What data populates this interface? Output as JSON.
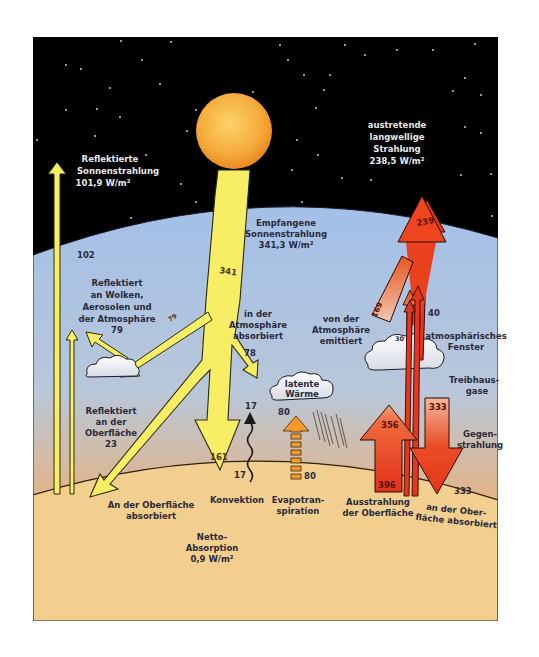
{
  "space": {
    "reflected_solar": {
      "title_line1": "Reflektierte",
      "title_line2": "Sonnenstrahlung",
      "value": "101,9 W/m²"
    },
    "outgoing_longwave": {
      "line1": "austretende",
      "line2": "langwellige",
      "line3": "Strahlung",
      "value": "238,5 W/m²"
    }
  },
  "atmosphere": {
    "incoming_solar": {
      "line1": "Empfangene",
      "line2": "Sonnenstrahlung",
      "value": "341,3 W/m²"
    },
    "reflected_clouds": {
      "line1": "Reflektiert",
      "line2": "an Wolken,",
      "line3": "Aerosolen und",
      "line4": "der Atmosphäre",
      "value": "79"
    },
    "absorbed_atmosphere": {
      "line1": "in der",
      "line2": "Atmosphäre",
      "line3": "absorbiert"
    },
    "emitted_atmosphere": {
      "line1": "von der",
      "line2": "Atmosphäre",
      "line3": "emittiert"
    },
    "atmospheric_window": {
      "line1": "atmosphärisches",
      "line2": "Fenster"
    },
    "greenhouse_gases": {
      "line1": "Treibhaus-",
      "line2": "gase"
    },
    "back_radiation": {
      "line1": "Gegen-",
      "line2": "strahlung"
    },
    "latent_heat": {
      "line1": "latente",
      "line2": "Wärme"
    },
    "reflected_surface": {
      "line1": "Reflektiert",
      "line2": "an der",
      "line3": "Oberfläche",
      "value": "23"
    }
  },
  "surface": {
    "absorbed_surface": {
      "line1": "An der Oberfläche",
      "line2": "absorbiert"
    },
    "convection": {
      "label": "Konvektion"
    },
    "evapotranspiration": {
      "line1": "Evapotran-",
      "line2": "spiration"
    },
    "surface_radiation": {
      "line1": "Ausstrahlung",
      "line2": "der Oberfläche"
    },
    "surface_absorbed_back": {
      "line1": "an der Ober-",
      "line2": "fläche absorbiert"
    },
    "net_absorption": {
      "line1": "Netto-",
      "line2": "Absorption",
      "value": "0,9 W/m²"
    }
  },
  "flows": {
    "reflected_total": "102",
    "incoming": "341",
    "reflected_atmosphere": "79",
    "absorbed_atmosphere": "78",
    "absorbed_surface": "161",
    "convection_top": "17",
    "convection_bottom": "17",
    "evap_top": "80",
    "evap_bottom": "80",
    "outgoing": "239",
    "emitted_atmosphere": "169",
    "emitted_clouds": "30",
    "window": "40",
    "surface_emission_top": "356",
    "surface_emission_bottom": "396",
    "back_radiation_top": "333",
    "back_radiation_bottom": "333"
  },
  "colors": {
    "space": "#000000",
    "sky_top": "#a9c4e6",
    "sky_bottom": "#e7a468",
    "ground": "#f3cf8f",
    "solar_yellow": "#f7ee66",
    "infrared_red": "#e8351c",
    "evap_orange": "#f39a2c",
    "sun": "#f4a838"
  }
}
